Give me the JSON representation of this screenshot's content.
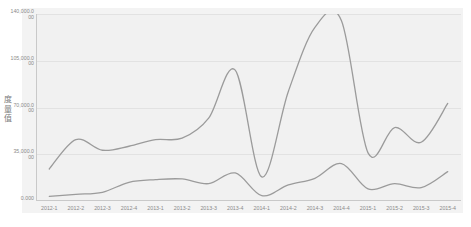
{
  "chart_data": {
    "type": "line",
    "title": "",
    "xlabel": "",
    "ylabel": "度量值",
    "ylim": [
      0,
      140000
    ],
    "grid": true,
    "legend": "none",
    "yticks": [
      {
        "value": 140000,
        "label": "140,000.000"
      },
      {
        "value": 105000,
        "label": "105,000.000"
      },
      {
        "value": 70000,
        "label": "70,000.000"
      },
      {
        "value": 35000,
        "label": "35,000.000"
      },
      {
        "value": 0,
        "label": "0.000"
      }
    ],
    "categories": [
      "2012-1",
      "2012-2",
      "2012-3",
      "2012-4",
      "2013-1",
      "2013-2",
      "2013-3",
      "2013-4",
      "2014-1",
      "2014-2",
      "2014-3",
      "2014-4",
      "2015-1",
      "2015-2",
      "2015-3",
      "2015-4"
    ],
    "series": [
      {
        "name": "series-upper",
        "color": "#9b9b9b",
        "values": [
          24000,
          46000,
          38000,
          41000,
          46000,
          47000,
          62000,
          98000,
          18000,
          82000,
          130000,
          135000,
          36000,
          55000,
          44000,
          73000
        ]
      },
      {
        "name": "series-lower",
        "color": "#9b9b9b",
        "values": [
          3500,
          5000,
          6500,
          14000,
          16000,
          16500,
          13000,
          21000,
          4000,
          12000,
          17000,
          28000,
          9000,
          13000,
          10000,
          22000
        ]
      }
    ]
  },
  "axis": {
    "y_title": "度量值",
    "zero_label": "0.000"
  }
}
